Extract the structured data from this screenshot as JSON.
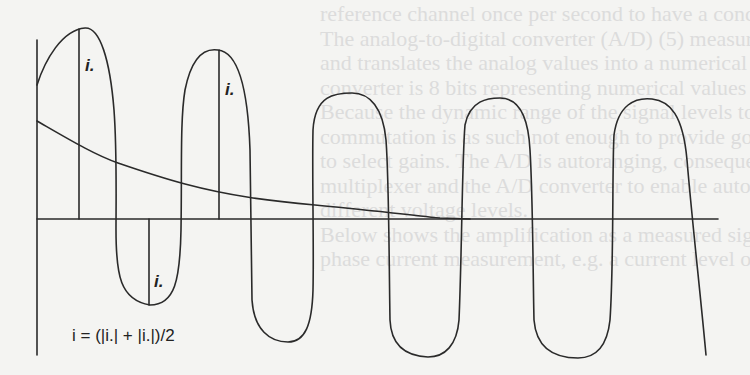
{
  "figure": {
    "type": "waveform-diagram",
    "labels": {
      "peak_label_1": "i.",
      "peak_label_2": "i.",
      "trough_label": "i."
    },
    "equation": "i = (|i.| + |i.|)/2",
    "colors": {
      "line": "#2a2a2a",
      "background": "#f4f4f2",
      "bleed_text": "#dcdcdc"
    }
  },
  "bleed_through_text": [
    "reference channel once per second to have a condition check for",
    "The analog-to-digital converter (A/D) (5) measures the speed",
    "and translates the analog values into a numerical form. The",
    "converter is 8 bits representing numerical values 0–255 (2^8) is",
    "Because the dynamic range of the signal levels to be measured",
    "commutation is as such not enough to provide good accuracy, a",
    "to select gains. The A/D is autoranging, consequently, selects the",
    "multiplexer and the A/D converter to enable automatic handling",
    "different voltage levels.",
    "Below shows the amplification as a measured signal time",
    "phase current measurement, e.g. a current level of 100 A in"
  ]
}
